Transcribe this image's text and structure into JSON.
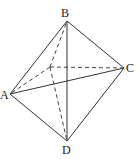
{
  "figure": {
    "type": "octahedron-like solid (two pyramids sharing a base)",
    "labels": {
      "B": "B",
      "A": "A",
      "C": "C",
      "D": "D"
    },
    "vertices": {
      "B": [
        67,
        21
      ],
      "A": [
        10,
        94
      ],
      "C": [
        124,
        68
      ],
      "D": [
        67,
        141
      ],
      "O": [
        50,
        67
      ]
    },
    "solid_edges": [
      [
        "B",
        "A"
      ],
      [
        "B",
        "C"
      ],
      [
        "B",
        "D"
      ],
      [
        "A",
        "C"
      ],
      [
        "A",
        "D"
      ],
      [
        "C",
        "D"
      ]
    ],
    "dashed_edges": [
      [
        "O",
        "B"
      ],
      [
        "O",
        "A"
      ],
      [
        "O",
        "C"
      ],
      [
        "O",
        "D"
      ]
    ],
    "colors": {
      "line": "#333333",
      "background": "#ffffff"
    }
  }
}
